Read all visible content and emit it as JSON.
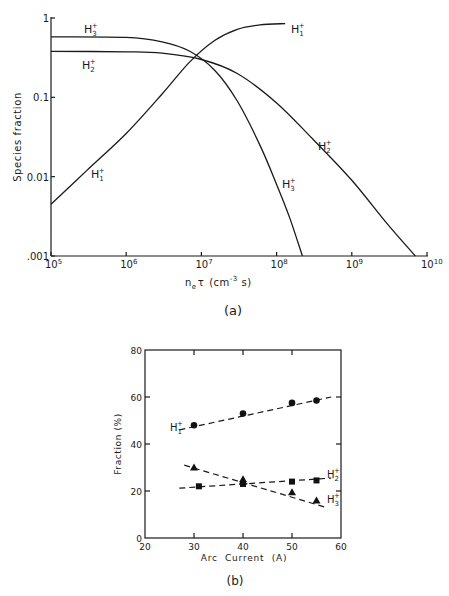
{
  "chart_data": [
    {
      "type": "line",
      "panel_label": "(a)",
      "title": "",
      "xlabel": "n_e τ (cm^-3 s)",
      "xlabel_parts": {
        "n": "n",
        "sub": "e",
        "tau": "τ",
        "unit": "(cm",
        "exp": "-3",
        "tail": " s)"
      },
      "ylabel": "Species fraction",
      "xscale": "log",
      "yscale": "log",
      "xlim": [
        100000,
        10000000000
      ],
      "ylim": [
        0.001,
        1
      ],
      "x_ticks": [
        {
          "value": 100000,
          "base": "10",
          "exp": "5"
        },
        {
          "value": 1000000,
          "base": "10",
          "exp": "6"
        },
        {
          "value": 10000000,
          "base": "10",
          "exp": "7"
        },
        {
          "value": 100000000,
          "base": "10",
          "exp": "8"
        },
        {
          "value": 1000000000,
          "base": "10",
          "exp": "9"
        },
        {
          "value": 10000000000,
          "base": "10",
          "exp": "10"
        }
      ],
      "y_ticks": [
        {
          "value": 1,
          "label": "1"
        },
        {
          "value": 0.1,
          "label": "0.1"
        },
        {
          "value": 0.01,
          "label": "0.01"
        },
        {
          "value": 0.001,
          "label": ".001"
        }
      ],
      "grid": false,
      "series": [
        {
          "name": "H1+",
          "label": {
            "base": "H",
            "sub": "1",
            "sup": "+"
          },
          "x": [
            100000,
            300000,
            1000000,
            3000000,
            7000000,
            15000000,
            30000000,
            60000000,
            130000000
          ],
          "y": [
            0.0045,
            0.012,
            0.035,
            0.11,
            0.28,
            0.52,
            0.72,
            0.82,
            0.85
          ]
        },
        {
          "name": "H2+",
          "label": {
            "base": "H",
            "sub": "2",
            "sup": "+"
          },
          "x": [
            100000,
            1000000,
            3000000,
            10000000,
            30000000,
            100000000,
            300000000,
            1000000000,
            3000000000,
            7000000000
          ],
          "y": [
            0.38,
            0.375,
            0.36,
            0.3,
            0.2,
            0.085,
            0.03,
            0.009,
            0.0025,
            0.001
          ]
        },
        {
          "name": "H3+",
          "label": {
            "base": "H",
            "sub": "3",
            "sup": "+"
          },
          "x": [
            100000,
            1000000,
            3000000,
            7000000,
            15000000,
            30000000,
            60000000,
            100000000,
            150000000,
            220000000
          ],
          "y": [
            0.58,
            0.57,
            0.5,
            0.38,
            0.22,
            0.09,
            0.025,
            0.008,
            0.003,
            0.001
          ]
        }
      ]
    },
    {
      "type": "scatter",
      "panel_label": "(b)",
      "title": "",
      "xlabel": "Arc  Current  (A)",
      "ylabel": "Fraction  (%)",
      "xlim": [
        20,
        60
      ],
      "ylim": [
        0,
        80
      ],
      "x_ticks": [
        20,
        30,
        40,
        50,
        60
      ],
      "y_ticks": [
        0,
        20,
        40,
        60,
        80
      ],
      "grid": false,
      "series": [
        {
          "name": "H1+",
          "label": {
            "base": "H",
            "sub": "1",
            "sup": "+"
          },
          "marker": "circle",
          "x": [
            30,
            40,
            50,
            55
          ],
          "y": [
            48,
            53,
            57.5,
            58.5
          ],
          "fit": {
            "x": [
              27,
              58
            ],
            "y": [
              46,
              60
            ]
          }
        },
        {
          "name": "H2+",
          "label": {
            "base": "H",
            "sub": "2",
            "sup": "+"
          },
          "marker": "square",
          "x": [
            31,
            40,
            50,
            55
          ],
          "y": [
            22,
            23,
            24,
            24.5
          ],
          "fit": {
            "x": [
              27,
              58
            ],
            "y": [
              21.2,
              25.5
            ]
          }
        },
        {
          "name": "H3+",
          "label": {
            "base": "H",
            "sub": "3",
            "sup": "+"
          },
          "marker": "triangle",
          "x": [
            30,
            40,
            40,
            50,
            55
          ],
          "y": [
            30,
            25,
            24,
            19.5,
            16
          ],
          "fit": {
            "x": [
              28,
              57
            ],
            "y": [
              31,
              13
            ]
          }
        }
      ]
    }
  ]
}
